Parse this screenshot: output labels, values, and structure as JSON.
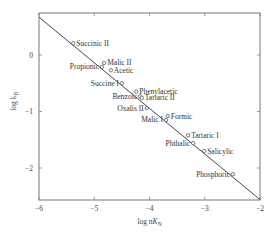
{
  "chart_data": {
    "type": "scatter",
    "title": "",
    "xlabel": "log nK_N",
    "ylabel": "log k_B",
    "xlim": [
      -6,
      -2
    ],
    "ylim": [
      -2.6,
      0.75
    ],
    "xticks": [
      -6,
      -5,
      -4,
      -3,
      -2
    ],
    "yticks": [
      0,
      -1,
      -2
    ],
    "xtick_labels": [
      "−6",
      "−5",
      "−4",
      "−3",
      "−2"
    ],
    "ytick_labels": [
      "0",
      "−1",
      "−2"
    ],
    "grid": false,
    "legend": null,
    "fit_line": {
      "x": [
        -6,
        -2
      ],
      "y": [
        0.67,
        -2.56
      ]
    },
    "points": [
      {
        "label": "Succinic II",
        "x": -5.38,
        "y": 0.21,
        "label_side": "right"
      },
      {
        "label": "Malic II",
        "x": -4.82,
        "y": -0.14,
        "label_side": "right"
      },
      {
        "label": "Propionic",
        "x": -4.86,
        "y": -0.21,
        "label_side": "left"
      },
      {
        "label": "Acetic",
        "x": -4.7,
        "y": -0.27,
        "label_side": "right"
      },
      {
        "label": "Succine I",
        "x": -4.5,
        "y": -0.5,
        "label_side": "left"
      },
      {
        "label": "Phenylacetic",
        "x": -4.24,
        "y": -0.65,
        "label_side": "right"
      },
      {
        "label": "Benzoic",
        "x": -4.17,
        "y": -0.73,
        "label_side": "left"
      },
      {
        "label": "Tartaric II",
        "x": -4.14,
        "y": -0.76,
        "label_side": "right"
      },
      {
        "label": "Oxalis II",
        "x": -4.05,
        "y": -0.94,
        "label_side": "left"
      },
      {
        "label": "Formic",
        "x": -3.67,
        "y": -1.08,
        "label_side": "right"
      },
      {
        "label": "Malic I",
        "x": -3.7,
        "y": -1.15,
        "label_side": "left"
      },
      {
        "label": "Tartaric I",
        "x": -3.3,
        "y": -1.42,
        "label_side": "right"
      },
      {
        "label": "Phthalic",
        "x": -3.21,
        "y": -1.56,
        "label_side": "left"
      },
      {
        "label": "Salicylic",
        "x": -3.01,
        "y": -1.7,
        "label_side": "right"
      },
      {
        "label": "Phosphoric",
        "x": -2.49,
        "y": -2.11,
        "label_side": "left"
      }
    ]
  },
  "colors": {
    "frame": "#777777",
    "line": "#333333",
    "marker": "#444444",
    "text": "#333333"
  }
}
